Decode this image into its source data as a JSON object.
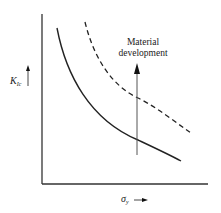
{
  "figure": {
    "y_axis_label_main": "K",
    "y_axis_label_sub": "Ic",
    "x_axis_label_main": "σ",
    "x_axis_label_sub": "y",
    "annotation_line1": "Material",
    "annotation_line2": "development"
  },
  "colors": {
    "line": "#222222",
    "arrow_shaft": "#555555",
    "background": "#ffffff"
  },
  "curves": [
    {
      "name": "baseline-material",
      "style": "solid"
    },
    {
      "name": "developed-material",
      "style": "dashed"
    }
  ]
}
